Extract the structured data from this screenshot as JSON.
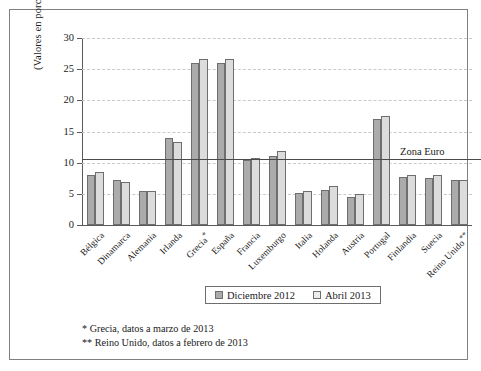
{
  "chart": {
    "axis_title": "(Valores en porcentaje)",
    "reference_line_label": "Zona Euro"
  },
  "legend": {
    "items": [
      {
        "label": "Diciembre 2012",
        "color": "#ababab"
      },
      {
        "label": "Abril 2013",
        "color": "#ececec"
      }
    ]
  },
  "notes": [
    "* Grecia, datos a marzo de 2013",
    "** Reino Unido, datos a febrero de 2013"
  ],
  "chart_data": {
    "type": "bar",
    "title": "",
    "subtitle": "",
    "xlabel": "",
    "ylabel": "(Valores en porcentaje)",
    "ylim": [
      0,
      30
    ],
    "yticks": [
      0,
      5,
      10,
      15,
      20,
      25,
      30
    ],
    "ytick_labels": [
      "0",
      "5",
      "10",
      "15",
      "20",
      "25",
      "30"
    ],
    "grid": true,
    "grid_axis": "y",
    "legend_position": "bottom-center",
    "categories": [
      "Bélgica",
      "Dinamarca",
      "Alemania",
      "Irlanda",
      "Grecia*",
      "España",
      "Francia",
      "Luxemburgo",
      "Italia",
      "Holanda",
      "Austria",
      "Portugal",
      "Finlandia",
      "Suecia",
      "Reino Unido**"
    ],
    "series": [
      {
        "name": "Diciembre 2012",
        "color": "#ababab",
        "values": [
          8.1,
          7.2,
          5.4,
          13.9,
          26.0,
          26.0,
          10.5,
          11.1,
          5.1,
          5.6,
          4.5,
          17.0,
          7.7,
          7.6,
          7.3
        ]
      },
      {
        "name": "Abril 2013",
        "color": "#ececec",
        "values": [
          8.5,
          6.9,
          5.4,
          13.3,
          26.6,
          26.7,
          10.8,
          11.8,
          5.5,
          6.2,
          4.9,
          17.5,
          8.0,
          8.1,
          7.3
        ]
      }
    ],
    "reference_lines": [
      {
        "label": "Zona Euro",
        "value": 10.6,
        "orientation": "horizontal"
      }
    ],
    "annotations": [
      "* Grecia, datos a marzo de 2013",
      "** Reino Unido, datos a febrero de 2013"
    ]
  }
}
